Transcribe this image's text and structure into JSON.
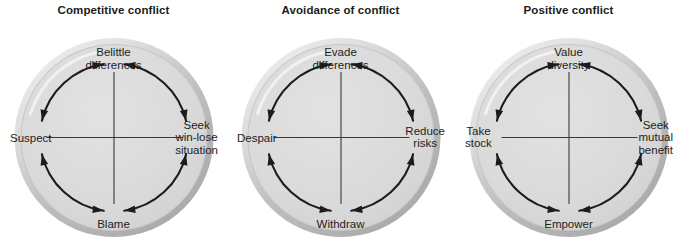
{
  "figure": {
    "type": "diagram",
    "shape": "cycle-circle",
    "panel_count": 3,
    "colors": {
      "disc_fill": "#d9d9d9",
      "ring_light": "#efefef",
      "ring_dark": "#a8a8a8",
      "axis_line": "#3a3a3a",
      "arrow": "#1c1c1c",
      "text": "#1d1d1d",
      "background": "#ffffff"
    }
  },
  "panels": [
    {
      "title": "Competitive conflict",
      "nodes": {
        "north": "Belittle\ndifferences",
        "east": "Seek\nwin-lose\nsituation",
        "south": "Blame",
        "west": "Suspect"
      },
      "arrows": [
        {
          "quadrant": "top-left",
          "from": "Suspect",
          "to": "Belittle differences",
          "heads": "both"
        },
        {
          "quadrant": "top-right",
          "from": "Seek win-lose situation",
          "to": "Belittle differences",
          "heads": "both"
        },
        {
          "quadrant": "bottom-left",
          "from": "Blame",
          "to": "Suspect",
          "heads": "both"
        },
        {
          "quadrant": "bottom-right",
          "from": "Blame",
          "to": "Seek win-lose situation",
          "heads": "both"
        }
      ]
    },
    {
      "title": "Avoidance of conflict",
      "nodes": {
        "north": "Evade\ndifferences",
        "east": "Reduce\nrisks",
        "south": "Withdraw",
        "west": "Despair"
      },
      "arrows": [
        {
          "quadrant": "top-left",
          "from": "Despair",
          "to": "Evade differences",
          "heads": "both"
        },
        {
          "quadrant": "top-right",
          "from": "Reduce risks",
          "to": "Evade differences",
          "heads": "both"
        },
        {
          "quadrant": "bottom-left",
          "from": "Withdraw",
          "to": "Despair",
          "heads": "both"
        },
        {
          "quadrant": "bottom-right",
          "from": "Withdraw",
          "to": "Reduce risks",
          "heads": "both"
        }
      ]
    },
    {
      "title": "Positive conflict",
      "nodes": {
        "north": "Value\ndiversity",
        "east": "Seek\nmutual\nbenefit",
        "south": "Empower",
        "west": "Take\nstock"
      },
      "arrows": [
        {
          "quadrant": "top-left",
          "from": "Take stock",
          "to": "Value diversity",
          "heads": "both"
        },
        {
          "quadrant": "top-right",
          "from": "Seek mutual benefit",
          "to": "Value diversity",
          "heads": "both"
        },
        {
          "quadrant": "bottom-left",
          "from": "Empower",
          "to": "Take stock",
          "heads": "both"
        },
        {
          "quadrant": "bottom-right",
          "from": "Empower",
          "to": "Seek mutual benefit",
          "heads": "both"
        }
      ]
    }
  ]
}
